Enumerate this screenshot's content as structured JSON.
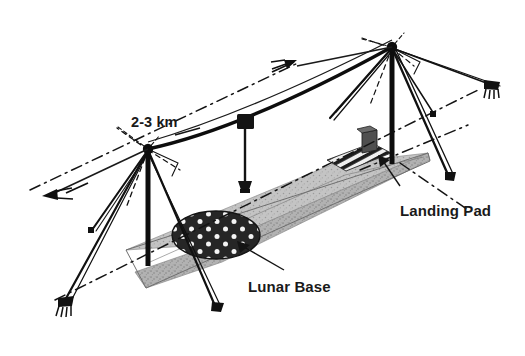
{
  "figure": {
    "type": "isometric-engineering-diagram",
    "background_color": "#ffffff",
    "width": 525,
    "height": 356
  },
  "labels": {
    "span_distance": "2-3 km",
    "landing_pad": "Landing Pad",
    "lunar_base": "Lunar Base"
  },
  "colors": {
    "ink": "#1a1a1a",
    "line": "#111111",
    "ground_fill": "#a8a8a8",
    "ground_fill_light": "#bdbdbd",
    "dome_fill": "#262626",
    "dome_dot": "#f2f2f2",
    "pad_stripe": "#1f1f1f",
    "pad_base": "#e8e8e8",
    "block_fill": "#4a4a4a",
    "background": "#ffffff"
  },
  "elements": {
    "left_tower": {
      "name": "left-guyed-tower",
      "top_x": 148,
      "top_y": 148,
      "base_x": 148,
      "base_y": 262,
      "guy_count": 6
    },
    "right_tower": {
      "name": "right-guyed-tower",
      "top_x": 392,
      "top_y": 46,
      "base_x": 392,
      "base_y": 160,
      "guy_count": 6
    },
    "main_cable": {
      "name": "main-span-cable",
      "from": [
        148,
        148
      ],
      "to": [
        392,
        46
      ],
      "sag": true
    },
    "carriage": {
      "name": "cable-carriage-trolley",
      "x": 245,
      "y": 121,
      "payload_x": 245,
      "payload_y": 185
    },
    "ground_strip": {
      "name": "lunar-surface-strip",
      "texture": "stippled-gray"
    },
    "lunar_base_dome": {
      "name": "lunar-base-dome",
      "cx": 216,
      "cy": 235,
      "rx": 43,
      "ry": 23,
      "dot_rows": 3,
      "dot_cols": 5
    },
    "landing_pad": {
      "name": "landing-pad-hatched-area",
      "stripe_count": 8
    },
    "anchors": [
      {
        "name": "anchor-lower-left",
        "x": 62,
        "y": 305
      },
      {
        "name": "anchor-upper-right",
        "x": 492,
        "y": 86
      },
      {
        "name": "anchor-left-mid",
        "x": 92,
        "y": 232
      },
      {
        "name": "anchor-right-mid",
        "x": 434,
        "y": 116
      }
    ],
    "direction_arrows": [
      {
        "name": "arrow-northeast",
        "x": 283,
        "y": 68,
        "direction": "up-right"
      },
      {
        "name": "arrow-southwest",
        "x": 45,
        "y": 196,
        "direction": "down-left"
      }
    ]
  }
}
